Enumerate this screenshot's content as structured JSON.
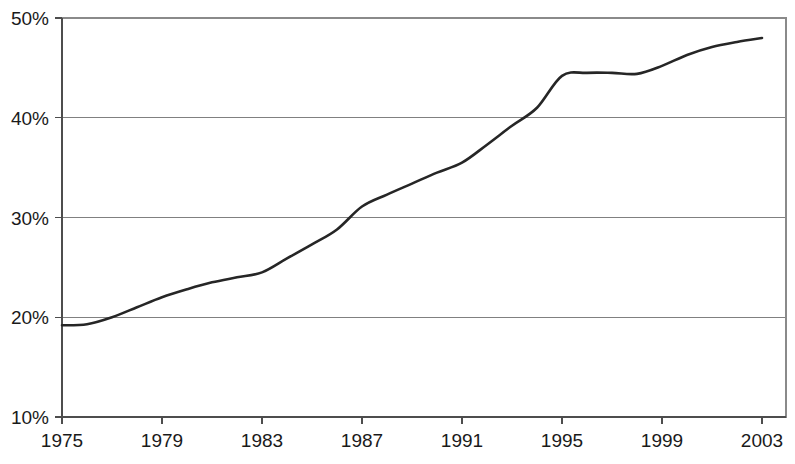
{
  "chart_data": {
    "type": "line",
    "title": "",
    "subtitle": "",
    "xlabel": "",
    "ylabel": "",
    "xlim": [
      1975,
      2003
    ],
    "ylim": [
      10,
      50
    ],
    "grid": true,
    "grid_axis": "y",
    "legend": false,
    "legend_position": "none",
    "y_tick_labels": [
      "50%",
      "40%",
      "30%",
      "20%",
      "10%"
    ],
    "y_tick_values": [
      50,
      40,
      30,
      20,
      10
    ],
    "x_tick_labels": [
      "1975",
      "1979",
      "1983",
      "1987",
      "1991",
      "1995",
      "1999",
      "2003"
    ],
    "x_tick_values": [
      1975,
      1979,
      1983,
      1987,
      1991,
      1995,
      1999,
      2003
    ],
    "y_unit": "percent",
    "line_color": "#262626",
    "series": [
      {
        "name": "",
        "x": [
          1975,
          1976,
          1977,
          1978,
          1979,
          1980,
          1981,
          1982,
          1983,
          1984,
          1985,
          1986,
          1987,
          1988,
          1989,
          1990,
          1991,
          1992,
          1993,
          1994,
          1995,
          1996,
          1997,
          1998,
          1999,
          2000,
          2001,
          2002,
          2003
        ],
        "values": [
          19.2,
          19.3,
          20.0,
          21.0,
          22.0,
          22.8,
          23.5,
          24.0,
          24.5,
          25.9,
          27.3,
          28.8,
          31.1,
          32.3,
          33.4,
          34.5,
          35.5,
          37.3,
          39.2,
          41.0,
          44.2,
          44.5,
          44.5,
          44.4,
          45.2,
          46.3,
          47.1,
          47.6,
          48.0
        ]
      }
    ]
  }
}
